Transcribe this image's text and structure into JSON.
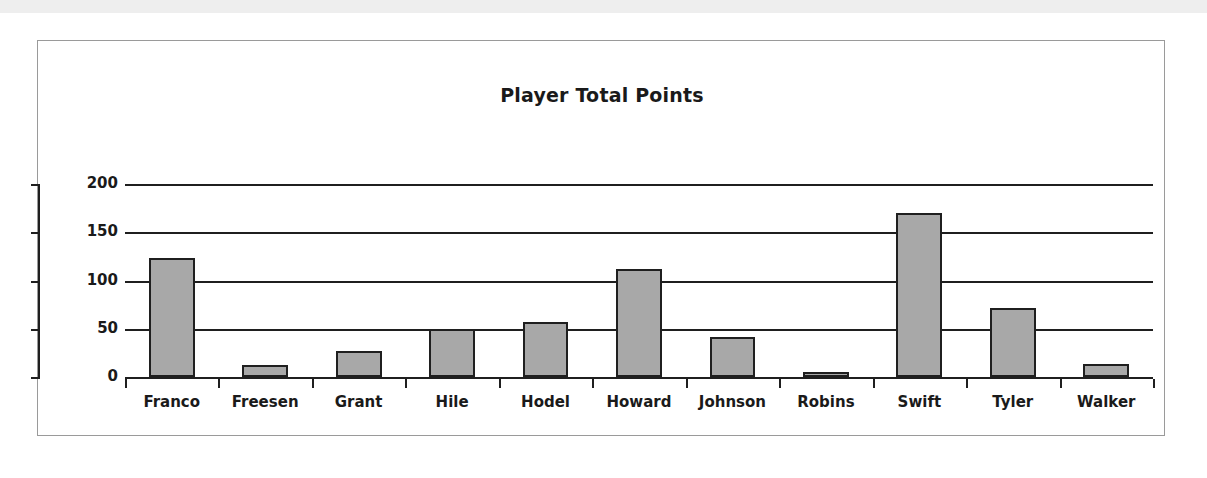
{
  "chart_data": {
    "type": "bar",
    "title": "Player Total Points",
    "xlabel": "",
    "ylabel": "",
    "categories": [
      "Franco",
      "Freesen",
      "Grant",
      "Hile",
      "Hodel",
      "Howard",
      "Johnson",
      "Robins",
      "Swift",
      "Tyler",
      "Walker"
    ],
    "values": [
      123,
      12,
      27,
      50,
      57,
      112,
      41,
      5,
      170,
      72,
      13
    ],
    "ylim": [
      0,
      200
    ],
    "ytick_labels": [
      "200",
      "150",
      "100",
      "50",
      "0"
    ],
    "ytick_values": [
      200,
      150,
      100,
      50,
      0
    ],
    "grid": true,
    "legend": "none",
    "series_name": "Total Points",
    "bar_fill_color": "#a8a8a8",
    "bar_border_color": "#1f1f1f",
    "axis_color": "#1f1f1f",
    "plot_background": "#ffffff"
  }
}
